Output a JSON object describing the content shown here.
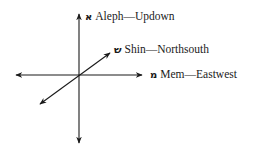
{
  "diagram": {
    "title": "",
    "axes": [
      {
        "id": "aleph",
        "letter": "א",
        "name": "Aleph",
        "direction": "Updown",
        "label": "Aleph—Updown"
      },
      {
        "id": "shin",
        "letter": "ש",
        "name": "Shin",
        "direction": "Northsouth",
        "label": "Shin—Northsouth"
      },
      {
        "id": "mem",
        "letter": "מ",
        "name": "Mem",
        "direction": "Eastwest",
        "label": "Mem—Eastwest"
      }
    ],
    "colors": {
      "line": "#1a1a1a",
      "text": "#1a1a1a",
      "background": "#ffffff"
    }
  }
}
